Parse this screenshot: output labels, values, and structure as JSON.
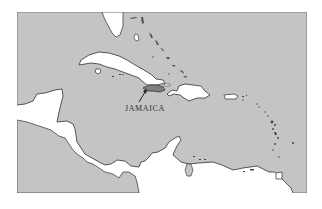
{
  "map": {
    "title": "Caribbean region map",
    "colors": {
      "sea": "#c4c4c4",
      "land": "#ffffff",
      "highlight": "#808080",
      "outline": "#444444",
      "frame": "#777777"
    },
    "labels": {
      "jamaica": "JAMAICA"
    },
    "features": [
      {
        "name": "Florida",
        "type": "land"
      },
      {
        "name": "Bahamas",
        "type": "islands"
      },
      {
        "name": "Cuba",
        "type": "island"
      },
      {
        "name": "Isle of Youth",
        "type": "island"
      },
      {
        "name": "Cayman Islands",
        "type": "islands"
      },
      {
        "name": "Jamaica",
        "type": "island",
        "highlighted": true
      },
      {
        "name": "Hispaniola",
        "type": "island"
      },
      {
        "name": "Puerto Rico",
        "type": "island"
      },
      {
        "name": "Lesser Antilles",
        "type": "islands"
      },
      {
        "name": "Trinidad",
        "type": "island"
      },
      {
        "name": "Yucatan / Central America",
        "type": "land"
      },
      {
        "name": "South America",
        "type": "land"
      }
    ]
  }
}
